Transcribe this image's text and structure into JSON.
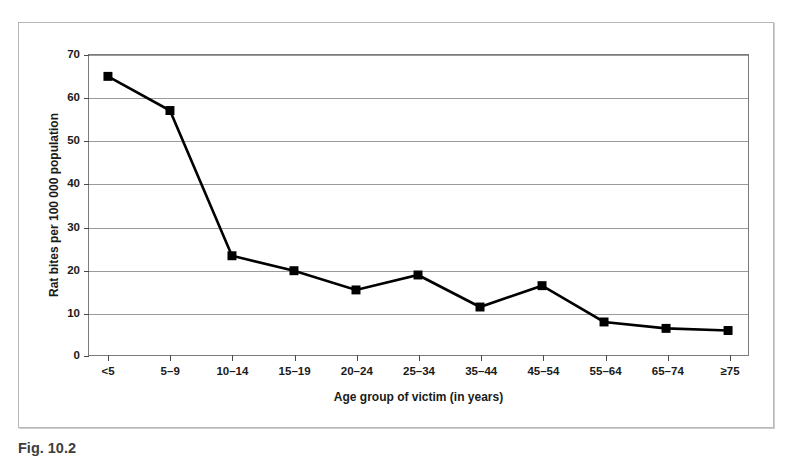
{
  "chart_data": {
    "type": "line",
    "title": "",
    "xlabel": "Age group of victim (in years)",
    "ylabel": "Rat bites per 100 000 population",
    "categories": [
      "<5",
      "5–9",
      "10–14",
      "15–19",
      "20–24",
      "25–34",
      "35–44",
      "45–54",
      "55–64",
      "65–74",
      "≥75"
    ],
    "values": [
      65,
      57,
      23,
      19.5,
      15,
      18.5,
      11,
      16,
      7.5,
      6,
      5.5
    ],
    "ylim": [
      0,
      70
    ],
    "ytick_labels": [
      "0",
      "10",
      "20",
      "30",
      "40",
      "50",
      "60",
      "70"
    ],
    "ytick_values": [
      0,
      10,
      20,
      30,
      40,
      50,
      60,
      70
    ],
    "grid": "horizontal",
    "legend": "none",
    "marker": "square",
    "series_color": "#000000",
    "gridline_color": "#9a9a9a",
    "axis_color": "#7b7b7b",
    "background": "#ffffff"
  },
  "figure": {
    "caption": "Fig. 10.2"
  }
}
